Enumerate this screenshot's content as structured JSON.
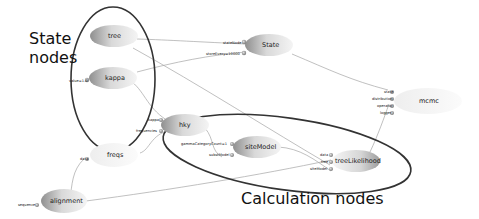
{
  "annotations": {
    "state_nodes_line1": "State",
    "state_nodes_line2": "nodes",
    "calculation_nodes": "Calculation nodes"
  },
  "nodes": {
    "tree": {
      "label": "tree"
    },
    "kappa": {
      "label": "kappa",
      "inputs": [
        "value=1.0"
      ]
    },
    "state": {
      "label": "State",
      "inputs": [
        "stateNode",
        "storeEvery=10000"
      ]
    },
    "mcmc": {
      "label": "mcmc",
      "inputs": [
        "state",
        "distribution",
        "operator",
        "logger"
      ]
    },
    "hky": {
      "label": "hky",
      "inputs": [
        "kappa",
        "frequencies"
      ]
    },
    "siteModel": {
      "label": "siteModel",
      "inputs": [
        "gammaCategoryCount=1",
        "substModel"
      ]
    },
    "treeLikelihood": {
      "label": "treeLikelihood",
      "inputs": [
        "data",
        "tree",
        "siteModel"
      ]
    },
    "freqs": {
      "label": "freqs",
      "inputs": [
        "data"
      ]
    },
    "alignment": {
      "label": "alignment",
      "inputs": [
        "sequence"
      ]
    }
  },
  "colors": {
    "node_dark": "#9a9a9a",
    "node_light": "#f2f2f2",
    "edge": "#9b9b9b",
    "group_outline": "#333333"
  }
}
